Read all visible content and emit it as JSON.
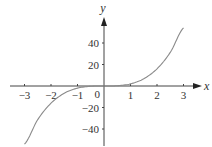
{
  "chart_data": {
    "type": "line",
    "title": "",
    "xlabel": "x",
    "ylabel": "y",
    "xlim": [
      -3.6,
      3.6
    ],
    "ylim": [
      -55,
      64
    ],
    "grid": false,
    "function": "y = 2x^3",
    "x_ticks": [
      {
        "value": -3,
        "label": "−3"
      },
      {
        "value": -2,
        "label": "−2"
      },
      {
        "value": -1,
        "label": "−1"
      },
      {
        "value": 1,
        "label": "1"
      },
      {
        "value": 2,
        "label": "2"
      },
      {
        "value": 3,
        "label": "3"
      }
    ],
    "y_ticks": [
      {
        "value": 40,
        "label": "40"
      },
      {
        "value": 20,
        "label": "20"
      },
      {
        "value": -20,
        "label": "−20"
      },
      {
        "value": -40,
        "label": "−40"
      }
    ],
    "origin_label": "0",
    "series": [
      {
        "name": "curve",
        "color": "#8a8a8a",
        "x": [
          -3.0,
          -2.5,
          -2.0,
          -1.5,
          -1.0,
          -0.5,
          0.0,
          0.5,
          1.0,
          1.5,
          2.0,
          2.5,
          3.0
        ],
        "y": [
          -54,
          -31.25,
          -16,
          -6.75,
          -2,
          -0.25,
          0,
          0.25,
          2,
          6.75,
          16,
          31.25,
          54
        ]
      }
    ]
  }
}
